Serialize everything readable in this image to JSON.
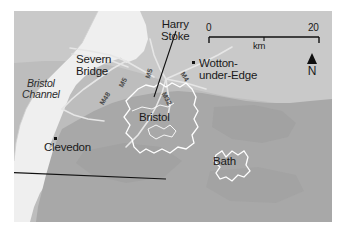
{
  "map": {
    "region": "Bristol and Severn Estuary area",
    "background_color": "#b9b9b9",
    "frame_color": "#ffffff",
    "places": [
      {
        "name": "Harry Stoke",
        "line1": "Harry",
        "line2": "Stoke",
        "has_leader_line": true
      },
      {
        "name": "Wotton-under-Edge",
        "line1": "Wotton-",
        "line2": "under-Edge",
        "has_marker": true
      },
      {
        "name": "Severn Bridge",
        "line1": "Severn",
        "line2": "Bridge",
        "has_marker": false
      },
      {
        "name": "Clevedon",
        "line1": "Clevedon",
        "has_marker": true
      },
      {
        "name": "Bristol",
        "line1": "Bristol",
        "type": "urban-area"
      },
      {
        "name": "Bath",
        "line1": "Bath",
        "type": "urban-area"
      }
    ],
    "water": {
      "name": "Bristol Channel",
      "line1": "Bristol",
      "line2": "Channel",
      "color": "#efefef"
    },
    "motorways": [
      {
        "label": "M48"
      },
      {
        "label": "M5"
      },
      {
        "label": "M4"
      },
      {
        "label": "M32"
      },
      {
        "label": "M5"
      }
    ],
    "scale_bar": {
      "min_label": "0",
      "max_label": "20",
      "units": "km",
      "length_km": 20
    },
    "north_arrow": {
      "label": "N",
      "icon": "north-arrow-icon"
    },
    "colors": {
      "sea": "#efefef",
      "land_light": "#c6c6c6",
      "land_dark": "#a9a9a9",
      "urban_outline": "#ffffff",
      "road": "#e8e8e8",
      "ink": "#1a1a1a"
    }
  }
}
